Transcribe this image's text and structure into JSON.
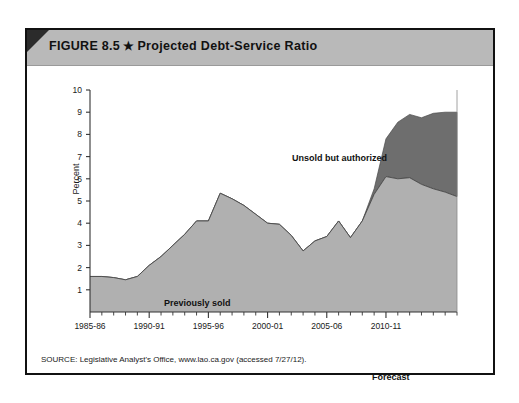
{
  "figure": {
    "label": "FIGURE 8.5",
    "star_glyph": "★",
    "title": "Projected Debt-Service Ratio"
  },
  "source_note": "SOURCE: Legislative Analyst's Office, www.lao.ca.gov (accessed 7/27/12).",
  "forecast_label": "Forecast",
  "colors": {
    "previously_sold": "#b0b0b0",
    "unsold_authorized": "#6e6e6e",
    "title_bar": "#b9b9b9",
    "corner_fold": "#2b2b2b",
    "frame": "#111111",
    "axis": "#333333"
  },
  "chart_data": {
    "type": "area",
    "stacked": true,
    "title": "Projected Debt-Service Ratio",
    "xlabel": "",
    "ylabel": "Percent",
    "ylim": [
      0,
      10
    ],
    "yticks": [
      0,
      1,
      2,
      3,
      4,
      5,
      6,
      7,
      8,
      9,
      10
    ],
    "ytick_labels": [
      "",
      "1",
      "2",
      "3",
      "4",
      "5",
      "6",
      "7",
      "8",
      "9",
      "10"
    ],
    "grid": false,
    "legend": "inline-annotations",
    "x": [
      "1985-86",
      "1986-87",
      "1987-88",
      "1988-89",
      "1989-90",
      "1990-91",
      "1991-92",
      "1992-93",
      "1993-94",
      "1994-95",
      "1995-96",
      "1996-97",
      "1997-98",
      "1998-99",
      "1999-00",
      "2000-01",
      "2001-02",
      "2002-03",
      "2003-04",
      "2004-05",
      "2005-06",
      "2006-07",
      "2007-08",
      "2008-09",
      "2009-10",
      "2010-11",
      "2011-12",
      "2012-13",
      "2013-14",
      "2014-15",
      "2015-16",
      "2016-17"
    ],
    "xtick_labels": [
      "1985-86",
      "1990-91",
      "1995-96",
      "2000-01",
      "2005-06",
      "2010-11"
    ],
    "xtick_positions": [
      0,
      5,
      10,
      15,
      20,
      25
    ],
    "series": [
      {
        "name": "Previously sold",
        "color": "#b0b0b0",
        "values": [
          1.6,
          1.6,
          1.55,
          1.45,
          1.6,
          2.1,
          2.5,
          3.0,
          3.5,
          4.1,
          4.1,
          5.35,
          5.1,
          4.8,
          4.4,
          4.0,
          3.95,
          3.45,
          2.75,
          3.2,
          3.4,
          4.1,
          3.35,
          4.1,
          5.3,
          6.1,
          6.0,
          6.05,
          5.75,
          5.55,
          5.4,
          5.2
        ]
      },
      {
        "name": "Unsold but authorized",
        "color": "#6e6e6e",
        "values": [
          0,
          0,
          0,
          0,
          0,
          0,
          0,
          0,
          0,
          0,
          0,
          0,
          0,
          0,
          0,
          0,
          0,
          0,
          0,
          0,
          0,
          0,
          0,
          0,
          0.25,
          1.7,
          2.55,
          2.85,
          3.0,
          3.4,
          3.6,
          3.8
        ]
      }
    ],
    "annotations": [
      {
        "text": "Previously sold",
        "x_index": 9,
        "y_value": 1.7
      },
      {
        "text": "Unsold but authorized",
        "x_index": 21,
        "y_value": 8.2
      },
      {
        "text": "Forecast",
        "x_index": 26,
        "y_value": -1.2
      }
    ],
    "forecast_start_index": 24
  }
}
